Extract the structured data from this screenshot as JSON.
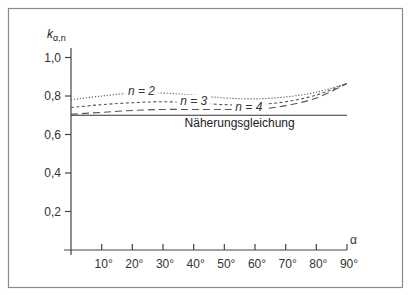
{
  "chart_data": {
    "type": "line",
    "title": "",
    "xlabel": "α",
    "ylabel": "k_α,n",
    "ylabel_main": "k",
    "ylabel_sub": "α,n",
    "xlim": [
      0,
      90
    ],
    "ylim": [
      0,
      1.1
    ],
    "grid": false,
    "legend_position": "inline labels on curves",
    "x_ticks": [
      10,
      20,
      30,
      40,
      50,
      60,
      70,
      80,
      90
    ],
    "x_tick_labels": [
      "10°",
      "20°",
      "30°",
      "40°",
      "50°",
      "60°",
      "70°",
      "80°",
      "90°"
    ],
    "y_ticks": [
      0.2,
      0.4,
      0.6,
      0.8,
      1.0
    ],
    "y_tick_labels": [
      "0,2",
      "0,4",
      "0,6",
      "0,8",
      "1,0"
    ],
    "x": [
      0,
      10,
      20,
      30,
      40,
      50,
      60,
      70,
      80,
      90
    ],
    "series": [
      {
        "name": "n = 2",
        "style": "dotted",
        "values": [
          0.78,
          0.8,
          0.815,
          0.815,
          0.805,
          0.79,
          0.785,
          0.795,
          0.82,
          0.865
        ]
      },
      {
        "name": "n = 3",
        "style": "short-dashed",
        "values": [
          0.74,
          0.755,
          0.765,
          0.77,
          0.765,
          0.755,
          0.755,
          0.77,
          0.805,
          0.865
        ]
      },
      {
        "name": "n = 4",
        "style": "long-dashed",
        "values": [
          0.705,
          0.715,
          0.725,
          0.73,
          0.73,
          0.73,
          0.73,
          0.75,
          0.79,
          0.865
        ]
      },
      {
        "name": "Näherungsgleichung",
        "style": "solid",
        "values": [
          0.7,
          0.7,
          0.7,
          0.7,
          0.7,
          0.7,
          0.7,
          0.7,
          0.7,
          0.7
        ]
      }
    ],
    "annotations": [
      {
        "text": "n = 2",
        "x": 23,
        "y": 0.815
      },
      {
        "text": "n = 3",
        "x": 40,
        "y": 0.765
      },
      {
        "text": "n = 4",
        "x": 58,
        "y": 0.73
      },
      {
        "text": "Näherungsgleichung",
        "x": 55,
        "y": 0.66
      }
    ]
  },
  "colors": {
    "frame": "#8a8a8a",
    "axis": "#444444",
    "curve": "#555555",
    "text": "#333333"
  }
}
